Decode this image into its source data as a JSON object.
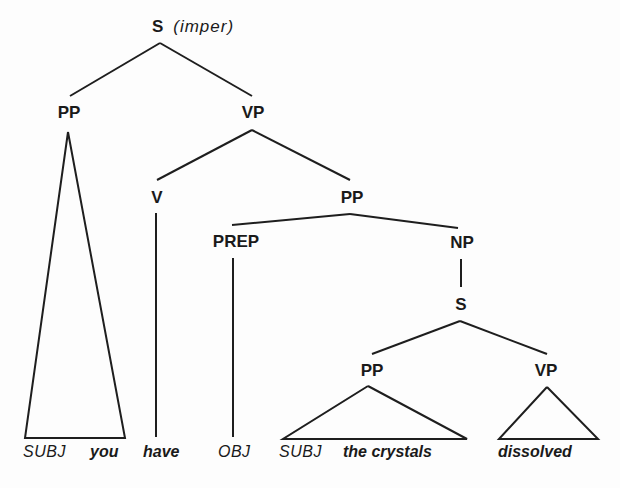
{
  "tree": {
    "root": {
      "label": "S",
      "annotation": "(imper)"
    },
    "nodes": {
      "pp_subj": "PP",
      "vp_main": "VP",
      "v": "V",
      "pp_obj": "PP",
      "prep": "PREP",
      "np": "NP",
      "s_embedded": "S",
      "pp_embedded": "PP",
      "vp_embedded": "VP"
    },
    "leaves": {
      "subj_role_1": "SUBJ",
      "you": "you",
      "have": "have",
      "obj_role": "OBJ",
      "subj_role_2": "SUBJ",
      "the_crystals": "the crystals",
      "dissolved": "dissolved"
    }
  }
}
